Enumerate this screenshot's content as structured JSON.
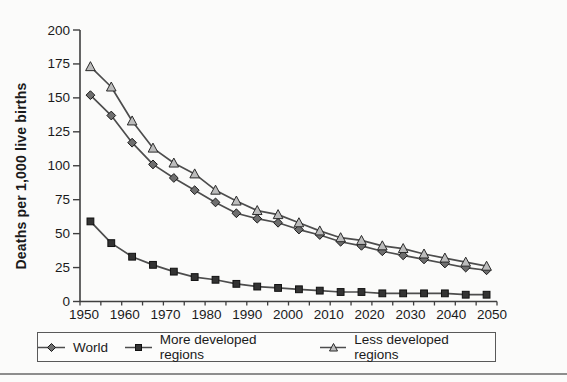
{
  "page": {
    "background": "#fbfbfa",
    "bottom_rule_color": "#8d8d8d"
  },
  "chart_data": {
    "type": "line",
    "title": "",
    "xlabel": "",
    "ylabel": "Deaths per 1,000 live births",
    "ylim": [
      0,
      200
    ],
    "y_tick_step": 25,
    "y_tick_labels": [
      "0",
      "25",
      "50",
      "75",
      "100",
      "125",
      "150",
      "175",
      "200"
    ],
    "x_tick_labels": [
      "1950",
      "1960",
      "1970",
      "1980",
      "1990",
      "2000",
      "2010",
      "2020",
      "2030",
      "2040",
      "2050"
    ],
    "x_minor_tick_count": 21,
    "grid": false,
    "legend_position": "bottom",
    "points_per_series": 20,
    "line_color": "#4d4d4d",
    "axis_color": "#3f3f3f",
    "text_color": "#1a1a1a",
    "series": [
      {
        "name": "World",
        "marker": "diamond",
        "marker_fill": "#6e6e6e",
        "marker_stroke": "#1a1a1a",
        "values": [
          152,
          137,
          117,
          101,
          91,
          82,
          73,
          65,
          61,
          58,
          53,
          49,
          44,
          41,
          37,
          34,
          31,
          28,
          25,
          23
        ]
      },
      {
        "name": "More developed regions",
        "marker": "square",
        "marker_fill": "#333333",
        "marker_stroke": "#111111",
        "values": [
          59,
          43,
          33,
          27,
          22,
          18,
          16,
          13,
          11,
          10,
          9,
          8,
          7,
          7,
          6,
          6,
          6,
          6,
          5,
          5
        ]
      },
      {
        "name": "Less developed regions",
        "marker": "triangle",
        "marker_fill": "#bcbcbc",
        "marker_stroke": "#2a2a2a",
        "values": [
          173,
          158,
          133,
          113,
          102,
          94,
          82,
          74,
          67,
          64,
          58,
          52,
          47,
          45,
          41,
          39,
          35,
          32,
          29,
          26
        ]
      }
    ]
  }
}
